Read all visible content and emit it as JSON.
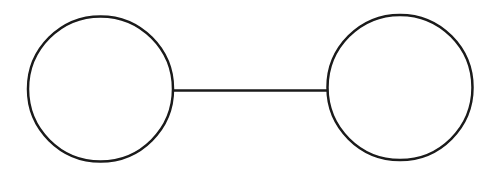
{
  "diagram": {
    "title": "",
    "type": "graph",
    "description": "Two empty circles connected by a single straight horizontal line",
    "canvas": {
      "width": 500,
      "height": 171,
      "background_color": "#ffffff"
    },
    "style": {
      "stroke_color": "#1a1a1a",
      "node_fill_color": "#ffffff",
      "node_stroke_width": 2.5,
      "edge_stroke_width": 2.5
    },
    "nodes": [
      {
        "id": "node-left",
        "name": "left-circle",
        "label": "",
        "shape": "circle",
        "cx": 100.5,
        "cy": 89,
        "r": 72.5
      },
      {
        "id": "node-right",
        "name": "right-circle",
        "label": "",
        "shape": "circle",
        "cx": 400,
        "cy": 87.5,
        "r": 72.5
      }
    ],
    "edges": [
      {
        "id": "edge-left-right",
        "name": "connecting-line",
        "label": "",
        "from": "node-left",
        "to": "node-right",
        "x1": 172,
        "y1": 90.5,
        "x2": 328,
        "y2": 90.5,
        "directed": false
      }
    ]
  }
}
